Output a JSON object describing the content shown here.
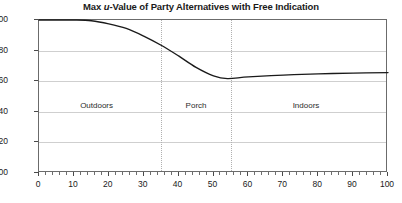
{
  "chart_data": {
    "type": "line",
    "title": "Max u-Value of Party Alternatives with Free Indication",
    "title_prefix": "Max ",
    "title_italic": "u",
    "title_suffix": "-Value of Party Alternatives with Free Indication",
    "xlabel": "",
    "ylabel": "",
    "xlim": [
      0,
      100
    ],
    "ylim": [
      0,
      1.0
    ],
    "grid": true,
    "legend": "none",
    "xticks": [
      0,
      10,
      20,
      30,
      40,
      50,
      60,
      70,
      80,
      90,
      100
    ],
    "xtick_labels": [
      "0",
      "10",
      "20",
      "30",
      "40",
      "50",
      "60",
      "70",
      "80",
      "90",
      "100"
    ],
    "minor_tick_step": 2,
    "yticks": [
      0.0,
      0.2,
      0.4,
      0.6,
      0.8,
      1.0
    ],
    "ytick_labels": [
      "0.00",
      "0.20",
      "0.40",
      "0.60",
      "0.80",
      "1.00"
    ],
    "series": [
      {
        "name": "Max u-Value",
        "color": "#1a1a1a",
        "x": [
          0,
          5,
          10,
          15,
          20,
          25,
          30,
          35,
          40,
          45,
          50,
          54,
          60,
          70,
          80,
          90,
          100
        ],
        "values": [
          1.0,
          1.0,
          1.0,
          0.995,
          0.975,
          0.945,
          0.895,
          0.835,
          0.765,
          0.69,
          0.635,
          0.617,
          0.628,
          0.64,
          0.648,
          0.653,
          0.656
        ]
      }
    ],
    "regions": [
      {
        "label": "Outdoors",
        "start": 0,
        "end": 35,
        "center": 16.5
      },
      {
        "label": "Porch",
        "start": 35,
        "end": 55,
        "center": 45.0
      },
      {
        "label": "Indoors",
        "start": 55,
        "end": 100,
        "center": 76.5
      }
    ],
    "dividers": [
      35,
      55
    ]
  }
}
